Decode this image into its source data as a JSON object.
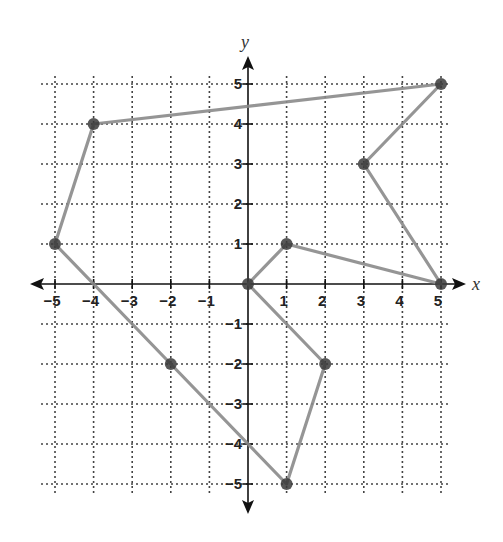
{
  "chart_data": {
    "type": "scatter",
    "title": "",
    "xlabel": "x",
    "ylabel": "y",
    "xlim": [
      -5,
      5
    ],
    "ylim": [
      -5,
      5
    ],
    "grid": "dotted",
    "x_ticks": [
      -5,
      -4,
      -3,
      -2,
      -1,
      1,
      2,
      3,
      4,
      5
    ],
    "y_ticks": [
      -5,
      -4,
      -3,
      -2,
      -1,
      1,
      2,
      3,
      4,
      5
    ],
    "points": [
      {
        "x": -4,
        "y": 4
      },
      {
        "x": 5,
        "y": 5
      },
      {
        "x": 3,
        "y": 3
      },
      {
        "x": 5,
        "y": 0
      },
      {
        "x": 1,
        "y": 1
      },
      {
        "x": 0,
        "y": 0
      },
      {
        "x": 2,
        "y": -2
      },
      {
        "x": 1,
        "y": -5
      },
      {
        "x": -2,
        "y": -2
      },
      {
        "x": -5,
        "y": 1
      }
    ],
    "path_order": "closed polygon connecting points in listed order, hand-drawn",
    "colors": {
      "grid": "#444444",
      "axis": "#111111",
      "path": "#8a8a8a",
      "point": "#3a3a3a"
    }
  },
  "labels": {
    "x_axis": "x",
    "y_axis": "y",
    "x_tick_labels": [
      "−5",
      "−4",
      "−3",
      "−2",
      "−1",
      "1",
      "2",
      "3",
      "4",
      "5"
    ],
    "y_tick_labels": [
      "5",
      "4",
      "3",
      "2",
      "1",
      "−1",
      "−2",
      "−3",
      "−4",
      "−5"
    ]
  }
}
